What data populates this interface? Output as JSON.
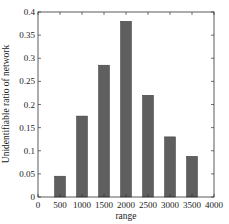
{
  "chart_data": {
    "type": "bar",
    "title": "",
    "xlabel": "range",
    "ylabel": "Unidentifiable ratio of network",
    "categories": [
      "500",
      "1000",
      "1500",
      "2000",
      "2500",
      "3000",
      "3500"
    ],
    "x": [
      500,
      1000,
      1500,
      2000,
      2500,
      3000,
      3500
    ],
    "values": [
      0.045,
      0.175,
      0.285,
      0.38,
      0.22,
      0.13,
      0.088
    ],
    "xlim": [
      0,
      4000
    ],
    "ylim": [
      0,
      0.4
    ],
    "xticks": [
      "0",
      "500",
      "1000",
      "1500",
      "2000",
      "2500",
      "3000",
      "3500",
      "4000"
    ],
    "yticks": [
      "0",
      "0.05",
      "0.1",
      "0.15",
      "0.2",
      "0.25",
      "0.3",
      "0.35",
      "0.4"
    ],
    "grid": false,
    "legend": null,
    "bar_color": "#5f5f5f"
  }
}
